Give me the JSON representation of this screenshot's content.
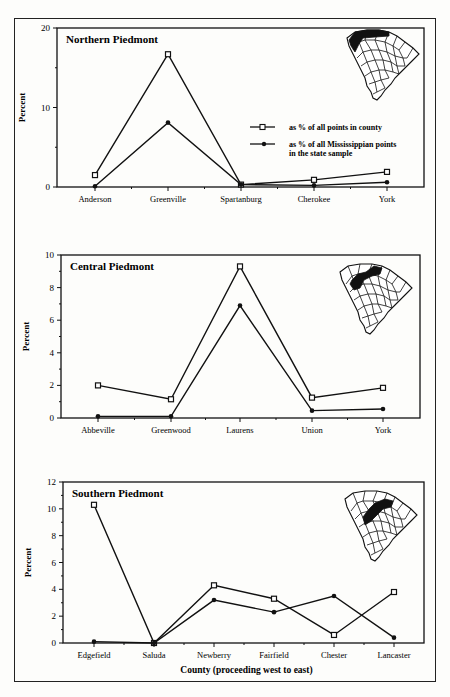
{
  "chart_data": [
    {
      "type": "line",
      "title": "Northern Piedmont",
      "xlabel": "",
      "ylabel": "Percent",
      "ylim": [
        0,
        20
      ],
      "yticks": [
        0,
        10,
        20
      ],
      "grid": false,
      "categories": [
        "Anderson",
        "Greenville",
        "Spartanburg",
        "Cherokee",
        "York"
      ],
      "series": [
        {
          "name": "as % of all points in county",
          "marker": "square",
          "values": [
            1.5,
            16.7,
            0.3,
            0.9,
            1.9
          ]
        },
        {
          "name": "as % of all Mississippian points in the state sample",
          "marker": "diamond",
          "values": [
            0.1,
            8.1,
            0.3,
            0.2,
            0.6
          ]
        }
      ],
      "legend": {
        "position": "right-middle",
        "entries": [
          "as % of all points in county",
          "as % of all Mississippian points in the state sample"
        ]
      },
      "inset_map": "South Carolina map with Northern Piedmont counties highlighted"
    },
    {
      "type": "line",
      "title": "Central Piedmont",
      "xlabel": "",
      "ylabel": "Percent",
      "ylim": [
        0,
        10
      ],
      "yticks": [
        0,
        2,
        4,
        6,
        8,
        10
      ],
      "grid": false,
      "categories": [
        "Abbeville",
        "Greenwood",
        "Laurens",
        "Union",
        "York"
      ],
      "series": [
        {
          "name": "as % of all points in county",
          "marker": "square",
          "values": [
            2.0,
            1.15,
            9.3,
            1.25,
            1.85
          ]
        },
        {
          "name": "as % of all Mississippian points in the state sample",
          "marker": "diamond",
          "values": [
            0.1,
            0.1,
            6.9,
            0.45,
            0.55
          ]
        }
      ],
      "inset_map": "South Carolina map with Central Piedmont counties highlighted"
    },
    {
      "type": "line",
      "title": "Southern Piedmont",
      "xlabel": "County (proceeding west to east)",
      "ylabel": "Percent",
      "ylim": [
        0,
        12
      ],
      "yticks": [
        0,
        2,
        4,
        6,
        8,
        10,
        12
      ],
      "grid": false,
      "categories": [
        "Edgefield",
        "Saluda",
        "Newberry",
        "Fairfield",
        "Chester",
        "Lancaster"
      ],
      "series": [
        {
          "name": "as % of all points in county",
          "marker": "square",
          "values": [
            10.3,
            0.0,
            4.3,
            3.3,
            0.6,
            3.8
          ]
        },
        {
          "name": "as % of all Mississippian points in the state sample",
          "marker": "diamond",
          "values": [
            0.1,
            0.0,
            3.2,
            2.3,
            3.5,
            0.4
          ]
        }
      ],
      "inset_map": "South Carolina map with Southern Piedmont counties highlighted"
    }
  ],
  "labels": {
    "chart1_title": "Northern  Piedmont",
    "chart2_title": "Central  Piedmont",
    "chart3_title": "Southern  Piedmont",
    "ylabel": "Percent",
    "xtitle": "County (proceeding west to east)",
    "legend_1": "as % of all points in county",
    "legend_2a": "as % of all Mississippian points",
    "legend_2b": "in the state sample"
  }
}
